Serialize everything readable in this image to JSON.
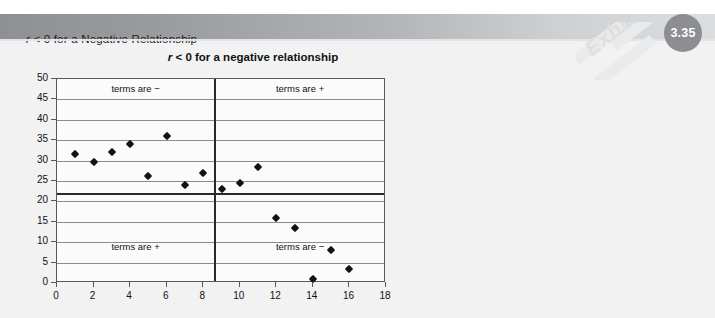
{
  "header": {
    "title_prefix": "r",
    "title_rest": " < 0 for a Negative Relationship",
    "badge": "3.35",
    "watermark": "Exhibit"
  },
  "chart_data": {
    "type": "scatter",
    "title_prefix": "r",
    "title_rest": " < 0 for a negative relationship",
    "xlabel": "",
    "ylabel": "",
    "xlim": [
      0,
      18
    ],
    "ylim": [
      0,
      50
    ],
    "xticks": [
      0,
      2,
      4,
      6,
      8,
      10,
      12,
      14,
      16,
      18
    ],
    "yticks": [
      0,
      5,
      10,
      15,
      20,
      25,
      30,
      35,
      40,
      45,
      50
    ],
    "grid": "horizontal",
    "legend": "none",
    "mean_line_y": 22,
    "divider_line_x": 8.6,
    "points": [
      {
        "x": 1,
        "y": 31.5
      },
      {
        "x": 2,
        "y": 29.7
      },
      {
        "x": 3,
        "y": 32.0
      },
      {
        "x": 4,
        "y": 34.0
      },
      {
        "x": 5,
        "y": 26.2
      },
      {
        "x": 6,
        "y": 36.0
      },
      {
        "x": 7,
        "y": 24.0
      },
      {
        "x": 8,
        "y": 27.0
      },
      {
        "x": 9,
        "y": 23.0
      },
      {
        "x": 10,
        "y": 24.5
      },
      {
        "x": 11,
        "y": 28.5
      },
      {
        "x": 12,
        "y": 16.0
      },
      {
        "x": 13,
        "y": 13.5
      },
      {
        "x": 14,
        "y": 1.0
      },
      {
        "x": 15,
        "y": 8.0
      },
      {
        "x": 16,
        "y": 3.5
      }
    ],
    "annotations": [
      {
        "name": "top-left",
        "text": "terms are −"
      },
      {
        "name": "top-right",
        "text": "terms are +"
      },
      {
        "name": "bottom-left",
        "text": "terms are +"
      },
      {
        "name": "bottom-right",
        "text": "terms are −"
      }
    ]
  },
  "colors": {
    "header_dark": "#8f9093",
    "header_light": "#dcdddf",
    "badge": "#8d8e91",
    "panel": "#f2f2f2",
    "point": "#121212",
    "gridline": "#8b8b8d",
    "axis": "#58585a"
  }
}
